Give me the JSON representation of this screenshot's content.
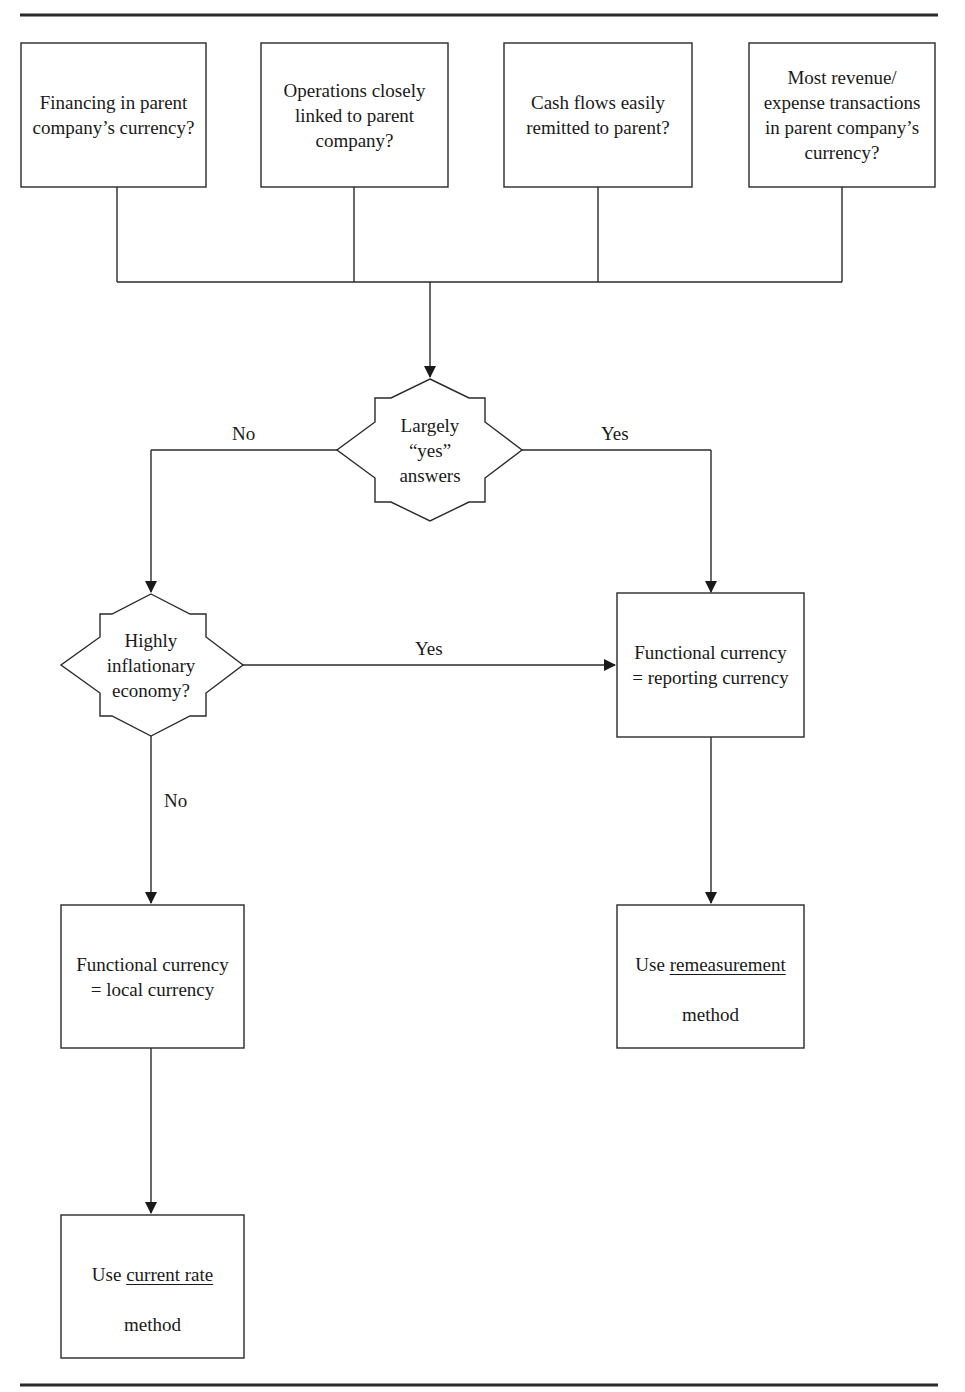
{
  "diagram": {
    "type": "flowchart",
    "questions": [
      {
        "id": "q1",
        "text": "Financing in parent\ncompany’s currency?"
      },
      {
        "id": "q2",
        "text": "Operations closely\nlinked to parent\ncompany?"
      },
      {
        "id": "q3",
        "text": "Cash flows easily\nremitted to parent?"
      },
      {
        "id": "q4",
        "text": "Most revenue/\nexpense transactions\nin parent company’s\ncurrency?"
      }
    ],
    "decisions": [
      {
        "id": "d1",
        "text": "Largely\n“yes”\nanswers"
      },
      {
        "id": "d2",
        "text": "Highly\ninflationary\neconomy?"
      }
    ],
    "outcomes": [
      {
        "id": "o1",
        "text": "Functional currency\n= reporting currency"
      },
      {
        "id": "o2",
        "text": "Functional currency\n= local currency"
      },
      {
        "id": "o3",
        "prefix": "Use ",
        "emphasis": "remeasurement",
        "suffix": "method"
      },
      {
        "id": "o4",
        "prefix": "Use ",
        "emphasis": "current rate",
        "suffix": "method"
      }
    ],
    "edge_labels": {
      "d1_no": "No",
      "d1_yes": "Yes",
      "d2_yes": "Yes",
      "d2_no": "No"
    },
    "edges": [
      {
        "from": "q1,q2,q3,q4",
        "to": "d1"
      },
      {
        "from": "d1",
        "to": "d2",
        "label": "No"
      },
      {
        "from": "d1",
        "to": "o1",
        "label": "Yes"
      },
      {
        "from": "d2",
        "to": "o1",
        "label": "Yes"
      },
      {
        "from": "d2",
        "to": "o2",
        "label": "No"
      },
      {
        "from": "o1",
        "to": "o3"
      },
      {
        "from": "o2",
        "to": "o4"
      }
    ]
  }
}
